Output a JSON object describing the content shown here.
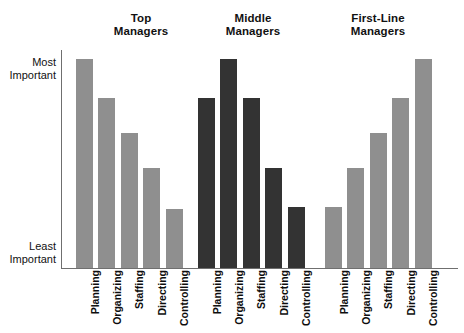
{
  "chart_data": {
    "type": "bar",
    "title": "",
    "subtitle": "",
    "xlabel": "",
    "ylabel": "",
    "grid": false,
    "legend_position": "none",
    "orientation": "vertical",
    "grouped": true,
    "y_axis": {
      "top_label": "Most Important",
      "top_label_lines": [
        "Most",
        "Important"
      ],
      "bottom_label": "Least Important",
      "bottom_label_lines": [
        "Least",
        "Important"
      ],
      "numeric_ticks": false,
      "ylim": [
        0,
        100
      ],
      "note": "ordinal importance scale, no numeric ticks drawn"
    },
    "categories": [
      "Planning",
      "Organizing",
      "Staffing",
      "Directing",
      "Controlling"
    ],
    "series": [
      {
        "name": "Top Managers",
        "name_lines": [
          "Top",
          "Managers"
        ],
        "color": "#8f8f8f",
        "values": [
          96,
          78,
          62,
          46,
          27
        ]
      },
      {
        "name": "Middle Managers",
        "name_lines": [
          "Middle",
          "Managers"
        ],
        "color": "#333333",
        "values": [
          78,
          96,
          78,
          46,
          28
        ]
      },
      {
        "name": "First-Line Managers",
        "name_lines": [
          "First-Line",
          "Managers"
        ],
        "color": "#8f8f8f",
        "values": [
          28,
          46,
          62,
          78,
          96
        ]
      }
    ],
    "axis_color": "#6f6f6f",
    "background": "#ffffff"
  },
  "groups": [
    {
      "header_line1": "Top",
      "header_line2": "Managers",
      "color": "#8f8f8f",
      "bars": [
        {
          "label": "Planning",
          "value": 96
        },
        {
          "label": "Organizing",
          "value": 78
        },
        {
          "label": "Staffing",
          "value": 62
        },
        {
          "label": "Directing",
          "value": 46
        },
        {
          "label": "Controlling",
          "value": 27
        }
      ]
    },
    {
      "header_line1": "Middle",
      "header_line2": "Managers",
      "color": "#333333",
      "bars": [
        {
          "label": "Planning",
          "value": 78
        },
        {
          "label": "Organizing",
          "value": 96
        },
        {
          "label": "Staffing",
          "value": 78
        },
        {
          "label": "Directing",
          "value": 46
        },
        {
          "label": "Controlling",
          "value": 28
        }
      ]
    },
    {
      "header_line1": "First-Line",
      "header_line2": "Managers",
      "color": "#8f8f8f",
      "bars": [
        {
          "label": "Planning",
          "value": 28
        },
        {
          "label": "Organizing",
          "value": 46
        },
        {
          "label": "Staffing",
          "value": 62
        },
        {
          "label": "Directing",
          "value": 78
        },
        {
          "label": "Controlling",
          "value": 96
        }
      ]
    }
  ],
  "y_axis": {
    "top_line1": "Most",
    "top_line2": "Important",
    "bottom_line1": "Least",
    "bottom_line2": "Important"
  }
}
